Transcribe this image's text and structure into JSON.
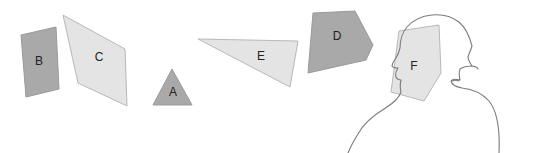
{
  "scene": {
    "title": "Geometric shapes and observer silhouette",
    "background_color": "#ffffff",
    "width": 537,
    "height": 153
  },
  "palette": {
    "dark_gray_fill": "#a9a9a9",
    "light_gray_fill": "#e4e4e4",
    "shape_stroke": "#9a9a9a",
    "light_shape_stroke": "#b8b8b8",
    "label_color": "#222222",
    "person_stroke": "#7b7b7b"
  },
  "shapes": [
    {
      "id": "shape-b",
      "label": "B",
      "kind": "quadrilateral",
      "fill": "#a9a9a9",
      "stroke": "#9a9a9a",
      "points": "21,35 56,27 59,89 26,97",
      "label_x": 39,
      "label_y": 62
    },
    {
      "id": "shape-c",
      "label": "C",
      "kind": "quadrilateral",
      "fill": "#e4e4e4",
      "stroke": "#b8b8b8",
      "points": "63,15 125,49 127,106 78,83",
      "label_x": 99,
      "label_y": 58
    },
    {
      "id": "shape-a",
      "label": "A",
      "kind": "triangle",
      "fill": "#a9a9a9",
      "stroke": "#9a9a9a",
      "points": "172,69 192,105 153,105",
      "label_x": 173,
      "label_y": 93
    },
    {
      "id": "shape-e",
      "label": "E",
      "kind": "triangle",
      "fill": "#e4e4e4",
      "stroke": "#b8b8b8",
      "points": "198,39 298,41 290,87",
      "label_x": 261,
      "label_y": 57
    },
    {
      "id": "shape-d",
      "label": "D",
      "kind": "pentagon",
      "fill": "#a9a9a9",
      "stroke": "#9a9a9a",
      "points": "313,13 355,11 373,45 366,60 308,73",
      "label_x": 337,
      "label_y": 37
    },
    {
      "id": "shape-f",
      "label": "F",
      "kind": "pentagon",
      "fill": "#e4e4e4",
      "stroke": "#b8b8b8",
      "points": "399,31 439,25 441,73 424,101 391,92",
      "label_x": 414,
      "label_y": 67
    }
  ],
  "person": {
    "id": "person-silhouette",
    "description": "Line drawing of a head and shoulders in profile facing left",
    "stroke": "#7b7b7b",
    "head_and_shoulders_path": "M 499 153 C 500 130 498 112 489 101 C 481 92 471 89 462 88 C 456 87 452 85 451 81 C 452 79 456 79 460 80 C 459 76 459 72 460 69 C 463 67 468 66 472 66 C 470 63 468 60 468 57 C 469 53 471 50 472 46 C 470 38 466 28 459 22 C 451 16 441 14 432 15 C 422 16 413 20 407 27 C 402 33 400 41 400 48 C 399 52 398 55 396 58 C 394 61 392 63 392 66 C 393 68 396 68 398 68 C 396 71 395 74 396 77 C 397 79 399 80 401 80 C 400 84 400 88 401 92 C 399 99 392 104 384 109 C 374 115 364 123 358 134 C 353 142 350 148 348 153",
    "ear_path": "M 452 81 C 454 80 457 80 459 81",
    "chin_detail_path": "M 471 66 C 474 66 477 67 478 69"
  }
}
